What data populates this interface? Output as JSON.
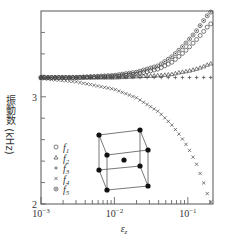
{
  "chart_data": {
    "type": "scatter",
    "title": "",
    "xlabel": "ε_z",
    "ylabel": "振動数 (kHz)",
    "xscale": "log",
    "xlim": [
      0.001,
      0.22
    ],
    "ylim": [
      2.0,
      3.8
    ],
    "x_ticks": [
      {
        "value": 0.001,
        "label_base": "10",
        "label_exp": "−3"
      },
      {
        "value": 0.01,
        "label_base": "10",
        "label_exp": "−2"
      },
      {
        "value": 0.1,
        "label_base": "10",
        "label_exp": "−1"
      }
    ],
    "y_ticks": [
      {
        "value": 2,
        "label": "2"
      },
      {
        "value": 3,
        "label": "3"
      }
    ],
    "y_minor_ticks": [
      2.2,
      2.4,
      2.6,
      2.8,
      3.2,
      3.4,
      3.6
    ],
    "grid": false,
    "legend_position": "lower-left",
    "series": [
      {
        "name": "f1",
        "sub": "1",
        "marker": "circle",
        "x": [
          0.001,
          0.003,
          0.01,
          0.02,
          0.04,
          0.06,
          0.08,
          0.1,
          0.13,
          0.16,
          0.2
        ],
        "y": [
          3.18,
          3.18,
          3.19,
          3.21,
          3.26,
          3.32,
          3.39,
          3.45,
          3.53,
          3.6,
          3.68
        ]
      },
      {
        "name": "f2",
        "sub": "2",
        "marker": "triangle",
        "x": [
          0.001,
          0.003,
          0.01,
          0.02,
          0.04,
          0.06,
          0.08,
          0.1,
          0.13,
          0.16,
          0.2
        ],
        "y": [
          3.18,
          3.18,
          3.18,
          3.19,
          3.2,
          3.21,
          3.23,
          3.24,
          3.26,
          3.28,
          3.31
        ]
      },
      {
        "name": "f3",
        "sub": "3",
        "marker": "plus",
        "x": [
          0.001,
          0.003,
          0.01,
          0.02,
          0.04,
          0.06,
          0.08,
          0.1,
          0.13,
          0.16,
          0.2
        ],
        "y": [
          3.18,
          3.18,
          3.18,
          3.18,
          3.18,
          3.18,
          3.18,
          3.18,
          3.18,
          3.18,
          3.18
        ]
      },
      {
        "name": "f4",
        "sub": "4",
        "marker": "cross",
        "x": [
          0.001,
          0.003,
          0.01,
          0.02,
          0.04,
          0.06,
          0.08,
          0.1,
          0.13,
          0.16,
          0.2
        ],
        "y": [
          3.17,
          3.14,
          3.07,
          2.99,
          2.86,
          2.74,
          2.63,
          2.53,
          2.38,
          2.22,
          2.02
        ]
      },
      {
        "name": "f5",
        "sub": "5",
        "marker": "circle-dot",
        "x": [
          0.001,
          0.003,
          0.01,
          0.02,
          0.04,
          0.06,
          0.08,
          0.1,
          0.13,
          0.16,
          0.2
        ],
        "y": [
          3.18,
          3.18,
          3.2,
          3.23,
          3.29,
          3.37,
          3.45,
          3.52,
          3.61,
          3.7,
          3.79
        ]
      }
    ],
    "inset": "body-centered cubic unit cell diagram (8 corner atoms + 1 center atom)"
  },
  "legend": {
    "items": [
      {
        "symbol": "○",
        "label": "f",
        "sub": "1"
      },
      {
        "symbol": "△",
        "label": "f",
        "sub": "2"
      },
      {
        "symbol": "+",
        "label": "f",
        "sub": "3"
      },
      {
        "symbol": "×",
        "label": "f",
        "sub": "4"
      },
      {
        "symbol": "⊙",
        "label": "f",
        "sub": "5"
      }
    ]
  },
  "axes": {
    "ylabel": "振動数 (kHz)",
    "xlabel_base": "ε",
    "xlabel_sub": "z"
  },
  "colors": {
    "axis": "#555555",
    "marker": "#444444",
    "text": "#333333"
  }
}
